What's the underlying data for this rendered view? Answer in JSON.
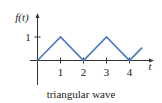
{
  "chart_data": {
    "type": "line",
    "title": "",
    "caption": "triangular wave",
    "xlabel": "t",
    "ylabel": "f(t)",
    "x": [
      0,
      1,
      2,
      3,
      4,
      4.55
    ],
    "series": [
      {
        "name": "f(t)",
        "values": [
          0,
          1,
          0,
          1,
          0,
          0.55
        ],
        "color": "#4a78c2"
      }
    ],
    "xticks": [
      "1",
      "2",
      "3",
      "4"
    ],
    "yticks": [
      "1"
    ],
    "xlim": [
      -0.3,
      5
    ],
    "ylim": [
      -1,
      1.7
    ],
    "grid": false,
    "legend": "none"
  },
  "labels": {
    "caption": "triangular wave",
    "y_axis": "f(t)",
    "x_axis": "t",
    "ytick_1": "1",
    "xtick_1": "1",
    "xtick_2": "2",
    "xtick_3": "3",
    "xtick_4": "4"
  }
}
